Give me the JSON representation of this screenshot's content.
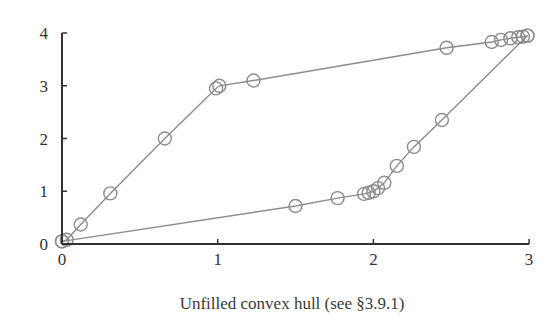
{
  "chart_data": {
    "type": "line",
    "title": "",
    "caption": "Unfilled convex hull (see §3.9.1)",
    "xlabel": "",
    "ylabel": "",
    "xlim": [
      0,
      3
    ],
    "ylim": [
      0,
      4
    ],
    "x_ticks": [
      "0",
      "1",
      "2",
      "3"
    ],
    "y_ticks": [
      "0",
      "1",
      "2",
      "3",
      "4"
    ],
    "grid": false,
    "legend": null,
    "marker": "unfilled-circle",
    "line_color": "#8c8c8c",
    "marker_color": "#8c8c8c",
    "axis_color": "#333333",
    "series": [
      {
        "name": "upper-hull",
        "points": [
          [
            0.0,
            0.05
          ],
          [
            0.03,
            0.08
          ],
          [
            0.12,
            0.37
          ],
          [
            0.31,
            0.96
          ],
          [
            0.66,
            2.0
          ],
          [
            0.99,
            2.95
          ],
          [
            1.01,
            3.0
          ],
          [
            1.23,
            3.1
          ],
          [
            2.47,
            3.72
          ],
          [
            2.76,
            3.83
          ],
          [
            2.82,
            3.87
          ],
          [
            2.88,
            3.9
          ],
          [
            2.93,
            3.92
          ],
          [
            2.96,
            3.93
          ],
          [
            2.99,
            3.95
          ]
        ]
      },
      {
        "name": "lower-hull",
        "points": [
          [
            0.0,
            0.05
          ],
          [
            1.5,
            0.72
          ],
          [
            1.77,
            0.87
          ],
          [
            1.94,
            0.95
          ],
          [
            1.97,
            0.97
          ],
          [
            2.0,
            1.0
          ],
          [
            2.03,
            1.06
          ],
          [
            2.07,
            1.16
          ],
          [
            2.15,
            1.48
          ],
          [
            2.26,
            1.84
          ],
          [
            2.44,
            2.35
          ],
          [
            2.99,
            3.95
          ]
        ]
      }
    ]
  },
  "layout": {
    "origin_px": [
      62,
      244
    ],
    "x_unit_px": 155.7,
    "y_unit_px": 52.75
  }
}
